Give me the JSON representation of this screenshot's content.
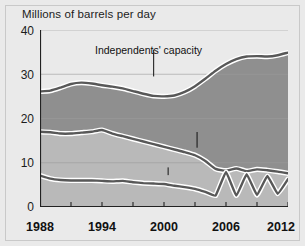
{
  "figure": {
    "title": "Millions of barrels per day",
    "background_color": "#eaeaea",
    "border_color": "#c9c9c9"
  },
  "chart_data": {
    "type": "area",
    "title": "Millions of barrels per day",
    "xlabel": "",
    "ylabel": "Millions of barrels per day",
    "xlim": [
      1988,
      2012
    ],
    "ylim": [
      0,
      40
    ],
    "grid": true,
    "legend_position": "inline-annotations",
    "y_ticks": [
      0,
      10,
      20,
      30,
      40
    ],
    "y_tick_labels": [
      "0",
      "10",
      "20",
      "30",
      "40"
    ],
    "x_ticks": [
      1988,
      1991,
      1994,
      1997,
      2000,
      2003,
      2006,
      2009,
      2012
    ],
    "x_tick_labels": [
      "1988",
      "",
      "1994",
      "",
      "2000",
      "",
      "2006",
      "",
      "2012"
    ],
    "x_major_labels": [
      "1988",
      "1994",
      "2000",
      "2006",
      "2012"
    ],
    "annotations": [
      {
        "text": "Independents' capacity",
        "x": 1999.0,
        "y": 36.0,
        "leader_to_y": 29.5
      },
      {
        "text": "Opportunists' production",
        "x": 2003.2,
        "y": 17.4,
        "leader_to_y": 13.4
      },
      {
        "text": "Swing producer's production",
        "x": 2000.4,
        "y": 9.4,
        "leader_to_y": 7.2
      }
    ],
    "colors": {
      "band_upper": "#8f8f8f",
      "band_lower": "#b9b9b9",
      "line": "#585858",
      "line_halo": "#ffffff",
      "grid": "#9a9a9a",
      "axis": "#222222"
    },
    "series": [
      {
        "name": "Independents' capacity",
        "x": [
          1988,
          1989,
          1990,
          1991,
          1992,
          1993,
          1994,
          1995,
          1996,
          1997,
          1998,
          1999,
          2000,
          2001,
          2002,
          2003,
          2004,
          2005,
          2006,
          2007,
          2008,
          2009,
          2010,
          2011,
          2012
        ],
        "values": [
          26.1,
          26.3,
          27.0,
          27.8,
          28.1,
          27.9,
          27.5,
          27.2,
          26.8,
          26.2,
          25.6,
          25.1,
          25.0,
          25.2,
          26.0,
          27.3,
          29.0,
          30.8,
          32.3,
          33.4,
          34.0,
          34.1,
          34.0,
          34.3,
          34.9
        ]
      },
      {
        "name": "Opportunists' production",
        "x": [
          1988,
          1989,
          1990,
          1991,
          1992,
          1993,
          1994,
          1995,
          1996,
          1997,
          1998,
          1999,
          2000,
          2001,
          2002,
          2003,
          2004,
          2005,
          2006,
          2007,
          2008,
          2009,
          2010,
          2011,
          2012
        ],
        "values": [
          17.0,
          16.9,
          16.6,
          16.6,
          16.8,
          17.0,
          17.4,
          16.6,
          16.0,
          15.4,
          14.8,
          14.2,
          13.6,
          13.0,
          12.4,
          11.7,
          10.4,
          8.6,
          8.2,
          8.7,
          8.1,
          8.5,
          8.3,
          8.0,
          7.6
        ]
      },
      {
        "name": "Swing producer's production",
        "x": [
          1988,
          1989,
          1990,
          1991,
          1992,
          1993,
          1994,
          1995,
          1996,
          1997,
          1998,
          1999,
          2000,
          2001,
          2002,
          2003,
          2004,
          2005,
          2006,
          2007,
          2008,
          2009,
          2010,
          2011,
          2012
        ],
        "values": [
          7.1,
          6.4,
          6.1,
          6.0,
          6.0,
          6.0,
          5.9,
          5.8,
          5.9,
          5.6,
          5.4,
          5.3,
          5.2,
          4.8,
          4.5,
          4.1,
          3.4,
          2.6,
          7.9,
          2.6,
          7.4,
          2.7,
          7.0,
          3.0,
          6.3
        ]
      }
    ]
  }
}
